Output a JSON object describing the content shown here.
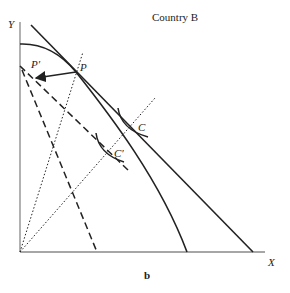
{
  "figure": {
    "title": "Country B",
    "panel_label": "b",
    "axes": {
      "y_label": "Y",
      "x_label": "X"
    },
    "points": [
      {
        "name": "P",
        "label": "P"
      },
      {
        "name": "P-prime",
        "label": "P′"
      },
      {
        "name": "C",
        "label": "C"
      },
      {
        "name": "C-prime",
        "label": "C′"
      }
    ],
    "elements": [
      "production possibility frontier (concave curve)",
      "pre-shift price line tangent at P",
      "dashed post-shift price lines through P′",
      "dotted rays from origin",
      "indifference curves at C and C′",
      "arrow from P to P′"
    ]
  }
}
